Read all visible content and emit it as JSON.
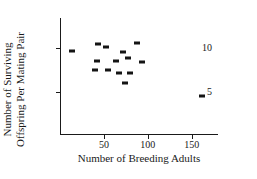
{
  "chart_data": {
    "type": "scatter",
    "title": "",
    "xlabel": "Number of Breeding Adults",
    "ylabel_line1": "Number of Surviving",
    "ylabel_line2": "Offspring Per Mating Pair",
    "xlim": [
      0,
      180
    ],
    "ylim": [
      0,
      13.5
    ],
    "xticks": [
      50,
      100,
      150
    ],
    "xticklabels": [
      "50",
      "100",
      "150"
    ],
    "yticks": [
      5,
      10
    ],
    "yticklabels": [
      "5",
      "10"
    ],
    "grid": false,
    "legend": null,
    "marker_color": "#141414",
    "axis_color": "#1a1a1a",
    "points": [
      {
        "x": 14,
        "y": 9.7
      },
      {
        "x": 40,
        "y": 7.5
      },
      {
        "x": 42,
        "y": 8.5
      },
      {
        "x": 43,
        "y": 10.5
      },
      {
        "x": 52,
        "y": 10.2
      },
      {
        "x": 55,
        "y": 7.5
      },
      {
        "x": 64,
        "y": 8.5
      },
      {
        "x": 67,
        "y": 7.1
      },
      {
        "x": 72,
        "y": 9.6
      },
      {
        "x": 74,
        "y": 6.0
      },
      {
        "x": 77,
        "y": 8.9
      },
      {
        "x": 80,
        "y": 7.2
      },
      {
        "x": 88,
        "y": 10.6
      },
      {
        "x": 93,
        "y": 8.4
      },
      {
        "x": 162,
        "y": 4.5
      }
    ]
  }
}
